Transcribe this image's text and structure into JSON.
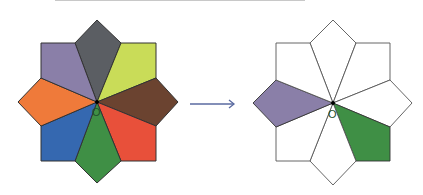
{
  "figure": {
    "center_label": "O",
    "left": {
      "pieces": [
        {
          "name": "top",
          "color": "#5b5e63"
        },
        {
          "name": "top-right",
          "color": "#c9dc58"
        },
        {
          "name": "right",
          "color": "#6b4330"
        },
        {
          "name": "bottom-right",
          "color": "#e8503a"
        },
        {
          "name": "bottom",
          "color": "#3f8f45"
        },
        {
          "name": "bottom-left",
          "color": "#3568b0"
        },
        {
          "name": "left",
          "color": "#ef7a3a"
        },
        {
          "name": "top-left",
          "color": "#8a7fa8"
        }
      ]
    },
    "right": {
      "shaded": [
        {
          "name": "left",
          "color": "#8a7fa8"
        },
        {
          "name": "bottom-right",
          "color": "#3f8f45"
        }
      ],
      "outline_color": "#555555"
    },
    "arrow": {
      "color": "#5a6aa0"
    }
  }
}
